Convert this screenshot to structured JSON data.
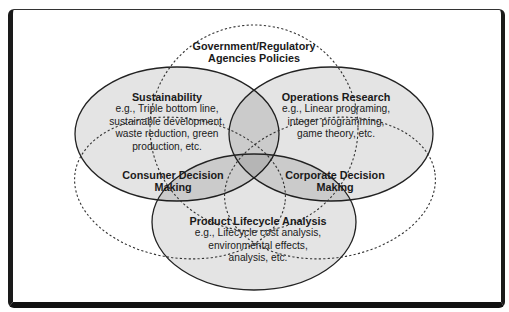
{
  "diagram": {
    "type": "venn",
    "colors": {
      "solid_fill": "#000000",
      "solid_fill_opacity": 0.1,
      "stroke": "#222222",
      "background": "#ffffff",
      "frame": "#1a1a1a"
    },
    "sets": [
      {
        "id": "government",
        "style": "dashed",
        "title_lines": [
          "Government/Regulatory",
          "Agencies Policies"
        ]
      },
      {
        "id": "sustainability",
        "style": "solid",
        "title": "Sustainability",
        "body_lines": [
          "e.g., Triple bottom line,",
          "sustainable development,",
          "waste reduction, green",
          "production, etc."
        ]
      },
      {
        "id": "operations-research",
        "style": "solid",
        "title": "Operations Research",
        "body_lines": [
          "e.g., Linear programing,",
          "integer programming,",
          "game theory, etc."
        ]
      },
      {
        "id": "consumer-decision",
        "style": "dashed",
        "title_lines": [
          "Consumer Decision",
          "Making"
        ]
      },
      {
        "id": "corporate-decision",
        "style": "dashed",
        "title_lines": [
          "Corporate Decision",
          "Making"
        ]
      },
      {
        "id": "product-lifecycle",
        "style": "solid",
        "title": "Product Lifecycle Analysis",
        "body_lines": [
          "e.g., Lifecycle cost analysis,",
          "environmental effects,",
          "analysis, etc."
        ]
      }
    ]
  }
}
